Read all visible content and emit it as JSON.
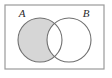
{
  "figure": {
    "kind": "venn-diagram",
    "title": "",
    "caption": "",
    "set_count": 2,
    "shaded_region_name": "A minus B",
    "shaded_region_notation": "A \\ B",
    "shaded_region_description": "The part of set A that is outside set B; the intersection is left unshaded."
  },
  "universe": {
    "name": "universal-set-rectangle",
    "label": "",
    "x": 5,
    "y": 5,
    "width": 99,
    "height": 64,
    "fill_color": "#ffffff",
    "stroke_color": "#9a9a9a",
    "stroke_width": 1.2
  },
  "circles": [
    {
      "id": "A",
      "label": "A",
      "label_x": 22,
      "label_y": 17,
      "cx": 40,
      "cy": 40,
      "r": 22,
      "filled": true,
      "fill_color": "#d6d6d6",
      "stroke_color": "#6f6f6f",
      "stroke_width": 1.1
    },
    {
      "id": "B",
      "label": "B",
      "label_x": 86,
      "label_y": 17,
      "cx": 69,
      "cy": 40,
      "r": 22,
      "filled": false,
      "fill_color": "#ffffff",
      "stroke_color": "#6f6f6f",
      "stroke_width": 1.1
    }
  ],
  "regions": [
    {
      "id": "a-only",
      "name": "A only",
      "shaded": true,
      "fill_color": "#d6d6d6"
    },
    {
      "id": "intersection",
      "name": "A and B",
      "shaded": false,
      "fill_color": "#ffffff"
    },
    {
      "id": "b-only",
      "name": "B only",
      "shaded": false,
      "fill_color": "#ffffff"
    },
    {
      "id": "outside",
      "name": "Outside A and B",
      "shaded": false,
      "fill_color": "#ffffff"
    }
  ],
  "labels": {
    "label_a": "A",
    "label_b": "B",
    "label_font_size": 11
  },
  "colors": {
    "shade": "#d6d6d6",
    "circle_stroke": "#6f6f6f",
    "rect_stroke": "#9a9a9a",
    "background": "#ffffff"
  }
}
